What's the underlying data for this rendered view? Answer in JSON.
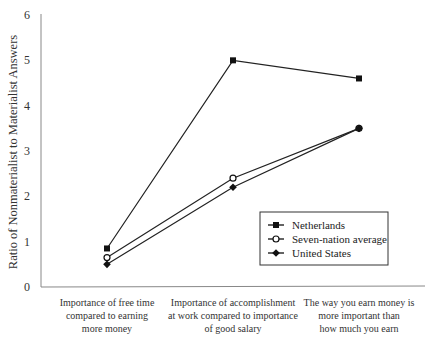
{
  "chart_data": {
    "type": "line",
    "title": "",
    "xlabel": "",
    "ylabel": "Ratio of Nonmaterialist to Materialist Answers",
    "ylim": [
      0,
      6
    ],
    "yticks": [
      "0",
      "1",
      "2",
      "3",
      "4",
      "5",
      "6"
    ],
    "grid": false,
    "legend_position": "bottom-right",
    "categories": [
      [
        "Importance of free time",
        "compared to earning",
        "more money"
      ],
      [
        "Importance of accomplishment",
        "at work compared to importance",
        "of good salary"
      ],
      [
        "The way you earn money is",
        "more important than",
        "how much you earn"
      ]
    ],
    "series": [
      {
        "name": "Netherlands",
        "marker": "square-filled",
        "values": [
          0.85,
          5.0,
          4.6
        ]
      },
      {
        "name": "Seven-nation average",
        "marker": "circle-open",
        "values": [
          0.65,
          2.4,
          3.5
        ]
      },
      {
        "name": "United States",
        "marker": "diamond-filled",
        "values": [
          0.5,
          2.2,
          3.5
        ]
      }
    ]
  }
}
